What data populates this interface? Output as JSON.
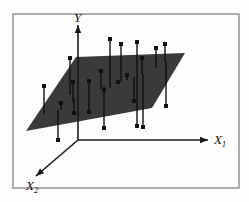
{
  "figure": {
    "caption": "",
    "background_color": "#fdfdfd",
    "frame": {
      "name": "figure-border",
      "x": 13,
      "y": 14,
      "width": 226,
      "height": 174,
      "stroke": "#9a9a9a",
      "stroke_width": 1.6
    }
  },
  "chart_data": {
    "type": "scatter",
    "title": "",
    "subtitle": "",
    "xlabel": "X_1",
    "ylabel": "Y",
    "zlabel": "X_2",
    "grid": false,
    "legend": null,
    "annotations": [],
    "axes": {
      "y_axis": {
        "label": "Y",
        "origin": [
          78,
          140
        ],
        "tip": [
          78,
          25
        ],
        "arrow": true,
        "color": "#1a1a1a"
      },
      "x1_axis": {
        "label": "X_1",
        "origin": [
          78,
          140
        ],
        "tip": [
          208,
          140
        ],
        "arrow": true,
        "color": "#1a1a1a"
      },
      "x2_axis": {
        "label": "X_2",
        "origin": [
          78,
          140
        ],
        "tip": [
          36,
          176
        ],
        "arrow": true,
        "color": "#1a1a1a"
      }
    },
    "plane": {
      "name": "regression-plane",
      "fill": "#3a3a3a",
      "opacity": 1,
      "corners": [
        [
          26,
          131
        ],
        [
          76,
          57
        ],
        [
          185,
          53
        ],
        [
          152,
          108
        ]
      ]
    },
    "axis_labels": {
      "y": {
        "base": "Y",
        "sub": "",
        "x": 74,
        "y": 22
      },
      "x1": {
        "base": "X",
        "sub": "1",
        "x": 214,
        "y": 144
      },
      "x2": {
        "base": "X",
        "sub": "2",
        "x": 26,
        "y": 190
      }
    },
    "marker": {
      "shape": "square",
      "size": 4,
      "color": "#111111",
      "stem_width": 1.4,
      "stem_color": "#111111"
    },
    "points": [
      {
        "id": 1,
        "marker_x": 44,
        "marker_y": 86,
        "plane_y": 114,
        "above": true
      },
      {
        "id": 2,
        "marker_x": 58,
        "marker_y": 140,
        "plane_y": 110,
        "above": false
      },
      {
        "id": 3,
        "marker_x": 61,
        "marker_y": 103,
        "plane_y": 110,
        "above": true
      },
      {
        "id": 4,
        "marker_x": 70,
        "marker_y": 58,
        "plane_y": 95,
        "above": true
      },
      {
        "id": 5,
        "marker_x": 73,
        "marker_y": 82,
        "plane_y": 103,
        "above": true
      },
      {
        "id": 6,
        "marker_x": 74,
        "marker_y": 113,
        "plane_y": 98,
        "above": false
      },
      {
        "id": 7,
        "marker_x": 89,
        "marker_y": 112,
        "plane_y": 94,
        "above": false
      },
      {
        "id": 8,
        "marker_x": 89,
        "marker_y": 81,
        "plane_y": 94,
        "above": true
      },
      {
        "id": 9,
        "marker_x": 101,
        "marker_y": 71,
        "plane_y": 89,
        "above": true
      },
      {
        "id": 10,
        "marker_x": 104,
        "marker_y": 128,
        "plane_y": 90,
        "above": false
      },
      {
        "id": 11,
        "marker_x": 110,
        "marker_y": 39,
        "plane_y": 88,
        "above": true
      },
      {
        "id": 12,
        "marker_x": 104,
        "marker_y": 90,
        "plane_y": 86,
        "above": true
      },
      {
        "id": 13,
        "marker_x": 121,
        "marker_y": 44,
        "plane_y": 82,
        "above": true
      },
      {
        "id": 14,
        "marker_x": 118,
        "marker_y": 82,
        "plane_y": 82,
        "above": true
      },
      {
        "id": 15,
        "marker_x": 127,
        "marker_y": 75,
        "plane_y": 80,
        "above": true
      },
      {
        "id": 16,
        "marker_x": 134,
        "marker_y": 101,
        "plane_y": 77,
        "above": false
      },
      {
        "id": 17,
        "marker_x": 137,
        "marker_y": 42,
        "plane_y": 76,
        "above": true
      },
      {
        "id": 18,
        "marker_x": 137,
        "marker_y": 126,
        "plane_y": 76,
        "above": false
      },
      {
        "id": 19,
        "marker_x": 142,
        "marker_y": 58,
        "plane_y": 74,
        "above": true
      },
      {
        "id": 20,
        "marker_x": 143,
        "marker_y": 127,
        "plane_y": 74,
        "above": false
      },
      {
        "id": 21,
        "marker_x": 156,
        "marker_y": 48,
        "plane_y": 68,
        "above": true
      },
      {
        "id": 22,
        "marker_x": 165,
        "marker_y": 44,
        "plane_y": 62,
        "above": true
      },
      {
        "id": 23,
        "marker_x": 166,
        "marker_y": 106,
        "plane_y": 62,
        "above": false
      }
    ]
  }
}
